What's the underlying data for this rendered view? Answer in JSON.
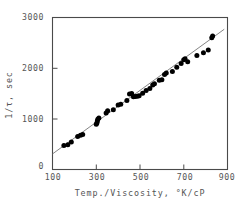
{
  "chart_data": {
    "type": "scatter",
    "title": "",
    "xlabel": "Temp./Viscosity,  °K/cP",
    "ylabel": "1/τ, sec",
    "xlim": [
      100,
      900
    ],
    "ylim": [
      -170,
      3000
    ],
    "xticks": [
      100,
      300,
      500,
      700,
      900
    ],
    "xticklabels": [
      "100",
      "300",
      "500",
      "700",
      "900"
    ],
    "yticks": [
      0,
      1000,
      2000,
      3000
    ],
    "yticklabels": [
      "0",
      "1000",
      "2000",
      "3000"
    ],
    "grid": false,
    "legend": null,
    "marker": "filled-circle",
    "series": [
      {
        "name": "measurements",
        "points": [
          [
            152,
            330
          ],
          [
            170,
            345
          ],
          [
            186,
            405
          ],
          [
            215,
            520
          ],
          [
            228,
            545
          ],
          [
            238,
            560
          ],
          [
            300,
            775
          ],
          [
            303,
            800
          ],
          [
            305,
            840
          ],
          [
            307,
            880
          ],
          [
            312,
            905
          ],
          [
            345,
            1010
          ],
          [
            352,
            1055
          ],
          [
            378,
            1075
          ],
          [
            400,
            1175
          ],
          [
            412,
            1190
          ],
          [
            440,
            1270
          ],
          [
            452,
            1405
          ],
          [
            462,
            1415
          ],
          [
            470,
            1345
          ],
          [
            478,
            1350
          ],
          [
            488,
            1360
          ],
          [
            496,
            1370
          ],
          [
            512,
            1420
          ],
          [
            528,
            1480
          ],
          [
            545,
            1520
          ],
          [
            558,
            1590
          ],
          [
            566,
            1620
          ],
          [
            588,
            1690
          ],
          [
            600,
            1700
          ],
          [
            612,
            1810
          ],
          [
            620,
            1845
          ],
          [
            648,
            1875
          ],
          [
            668,
            1960
          ],
          [
            688,
            2040
          ],
          [
            700,
            2120
          ],
          [
            706,
            2140
          ],
          [
            718,
            2075
          ],
          [
            760,
            2210
          ],
          [
            790,
            2265
          ],
          [
            812,
            2320
          ],
          [
            828,
            2580
          ],
          [
            832,
            2615
          ]
        ]
      }
    ],
    "fit_line": {
      "name": "linear-fit",
      "x_start": 100,
      "y_start": 155,
      "x_end": 885,
      "y_end": 2755
    }
  },
  "axis": {
    "x_label_text": "Temp./Viscosity,  °K/cP",
    "y_label_text": "1/τ, sec"
  }
}
